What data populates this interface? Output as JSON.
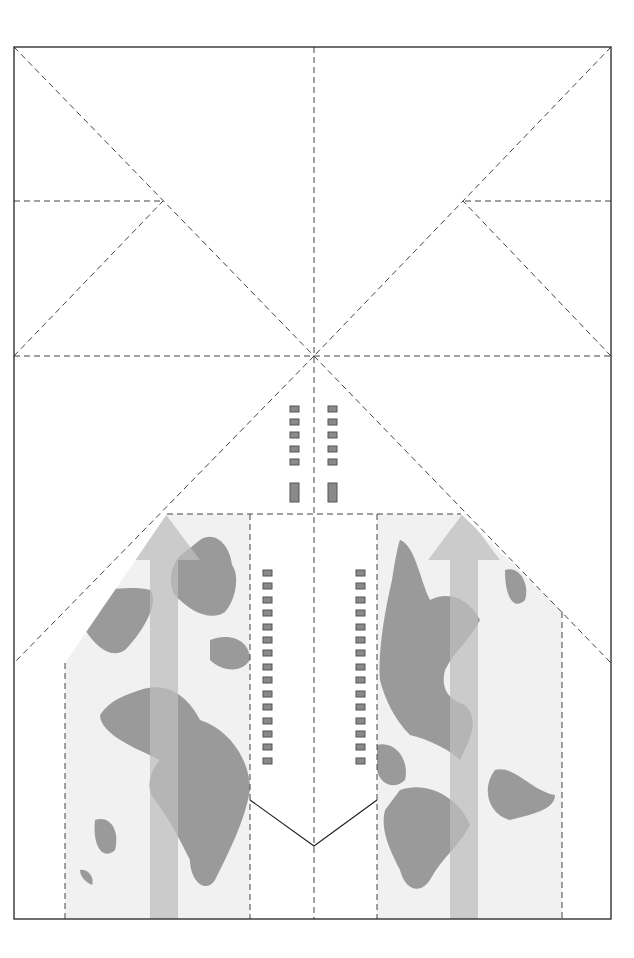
{
  "diagram": {
    "title": "",
    "colors": {
      "background": "#ffffff",
      "border": "#222222",
      "fold_line": "#444444",
      "map_panel": "#f1f1f1",
      "land": "#9a9a9a",
      "arrow": "#bdbdbd",
      "window": "#8a8a8a",
      "window_border": "#555555"
    },
    "legend": [],
    "labels": []
  }
}
